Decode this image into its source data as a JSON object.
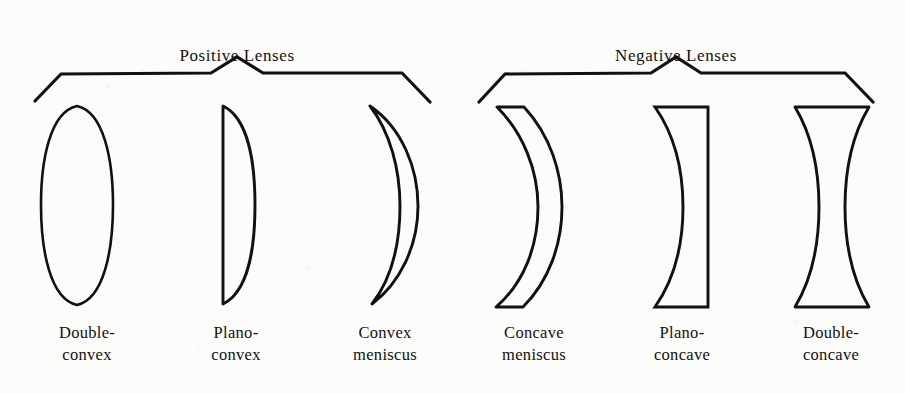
{
  "figure": {
    "background_color": "#fcfcfb",
    "ink_color": "#111111",
    "width": 905,
    "height": 393
  },
  "groups": [
    {
      "id": "positive-lenses",
      "title": "Positive Lenses",
      "title_center_x": 237,
      "title_y": 46,
      "bracket": "M35,101 L61,74 L211,73 L237,57 L263,73 L402,73 L430,102"
    },
    {
      "id": "negative-lenses",
      "title": "Negative Lenses",
      "title_center_x": 676,
      "title_y": 46,
      "bracket": "M479,102 L505,74 L651,73 L676,57 L701,73 L845,73 L873,102"
    }
  ],
  "lenses": [
    {
      "id": "double-convex",
      "group": "positive-lenses",
      "label_line1": "Double-",
      "label_line2": "convex",
      "label_center_x": 87,
      "label_top_y": 322,
      "shape": "M77,106 C104,112 113,160 113,205 C113,250 104,299 77,305 C50,299 41,250 41,205 C41,160 50,112 77,106 Z"
    },
    {
      "id": "plano-convex",
      "group": "positive-lenses",
      "label_line1": "Plano-",
      "label_line2": "convex",
      "label_center_x": 236,
      "label_top_y": 322,
      "shape": "M223,106 L223,304 C248,292 255,248 255,205 C255,162 248,118 223,106 Z"
    },
    {
      "id": "convex-meniscus",
      "group": "positive-lenses",
      "label_line1": "Convex",
      "label_line2": "meniscus",
      "label_center_x": 385,
      "label_top_y": 322,
      "shape": "M370,106 C402,128 418,168 418,206 C418,246 400,283 372,304 C392,278 400,243 400,206 C400,169 390,132 370,106 Z"
    },
    {
      "id": "concave-meniscus",
      "group": "negative-lenses",
      "label_line1": "Concave",
      "label_line2": "meniscus",
      "label_center_x": 534,
      "label_top_y": 322,
      "shape": "M497,107 L524,107 C550,135 562,172 562,207 C562,244 549,281 523,307 L496,307 C524,283 538,246 538,207 C538,170 523,133 497,107 Z"
    },
    {
      "id": "plano-concave",
      "group": "negative-lenses",
      "label_line1": "Plano-",
      "label_line2": "concave",
      "label_center_x": 682,
      "label_top_y": 322,
      "shape": "M655,107 L708,107 L708,307 L655,307 C676,277 683,243 683,207 C683,171 676,137 655,107 Z"
    },
    {
      "id": "double-concave",
      "group": "negative-lenses",
      "label_line1": "Double-",
      "label_line2": "concave",
      "label_center_x": 831,
      "label_top_y": 322,
      "shape": "M795,107 L869,107 C851,137 845,172 845,207 C845,242 851,277 869,307 L795,307 C813,277 819,242 819,207 C819,172 813,137 795,107 Z"
    }
  ]
}
